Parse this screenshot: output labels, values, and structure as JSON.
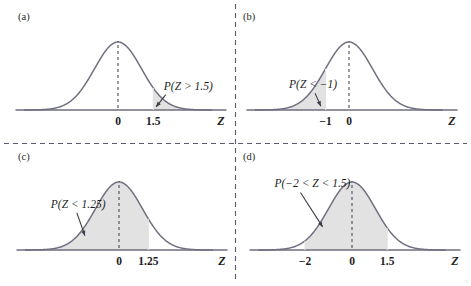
{
  "figure": {
    "background": "#ffffff",
    "curve_color": "#6f6f80",
    "shade_color": "#e2e2e2",
    "axis_color": "#6f6f80",
    "divider_color": "#5a5a6a",
    "text_color": "#1d1d1d",
    "corner_mark": "□"
  },
  "chart_data": {
    "type": "line",
    "xlabel": "Z",
    "ylabel": "",
    "distribution": "standard normal (mean 0, sd 1)",
    "grid": false,
    "legend": false,
    "panels": [
      {
        "id": "a",
        "panel_label": "(a)",
        "probability_label": "P(Z > 1.5)",
        "shade_type": "right-tail",
        "shade_from": 1.5,
        "shade_to": 4.0,
        "tick_labels": [
          "0",
          "1.5"
        ],
        "tick_values": [
          0,
          1.5
        ],
        "axis_name": "Z",
        "center_dashed_at": 0,
        "xlim": [
          -4.0,
          4.0
        ],
        "label_x": 1.95,
        "label_y": 0.3,
        "arrow_to_x": 1.62,
        "arrow_to_y": 0.045
      },
      {
        "id": "b",
        "panel_label": "(b)",
        "probability_label": "P(Z < −1)",
        "shade_type": "left-tail",
        "shade_from": -4.0,
        "shade_to": -1.0,
        "tick_labels": [
          "−1",
          "0"
        ],
        "tick_values": [
          -1,
          0
        ],
        "axis_name": "Z",
        "center_dashed_at": 0,
        "xlim": [
          -4.0,
          4.0
        ],
        "label_x": -2.55,
        "label_y": 0.32,
        "arrow_to_x": -1.2,
        "arrow_to_y": 0.055
      },
      {
        "id": "c",
        "panel_label": "(c)",
        "probability_label": "P(Z < 1.25)",
        "shade_type": "left-area",
        "shade_from": -4.0,
        "shade_to": 1.25,
        "tick_labels": [
          "0",
          "1.25"
        ],
        "tick_values": [
          0,
          1.25
        ],
        "axis_name": "Z",
        "center_dashed_at": 0,
        "xlim": [
          -4.0,
          4.0
        ],
        "label_x": -2.9,
        "label_y": 0.62,
        "arrow_to_x": -1.45,
        "arrow_to_y": 0.21
      },
      {
        "id": "d",
        "panel_label": "(d)",
        "probability_label": "P(−2 < Z < 1.5)",
        "shade_type": "between",
        "shade_from": -2.0,
        "shade_to": 1.5,
        "tick_labels": [
          "−2",
          "0",
          "1.5"
        ],
        "tick_values": [
          -2,
          0,
          1.5
        ],
        "axis_name": "Z",
        "center_dashed_at": 0,
        "xlim": [
          -4.0,
          4.0
        ],
        "label_x": -3.3,
        "label_y": 0.92,
        "arrow_to_x": -1.25,
        "arrow_to_y": 0.34
      }
    ]
  }
}
